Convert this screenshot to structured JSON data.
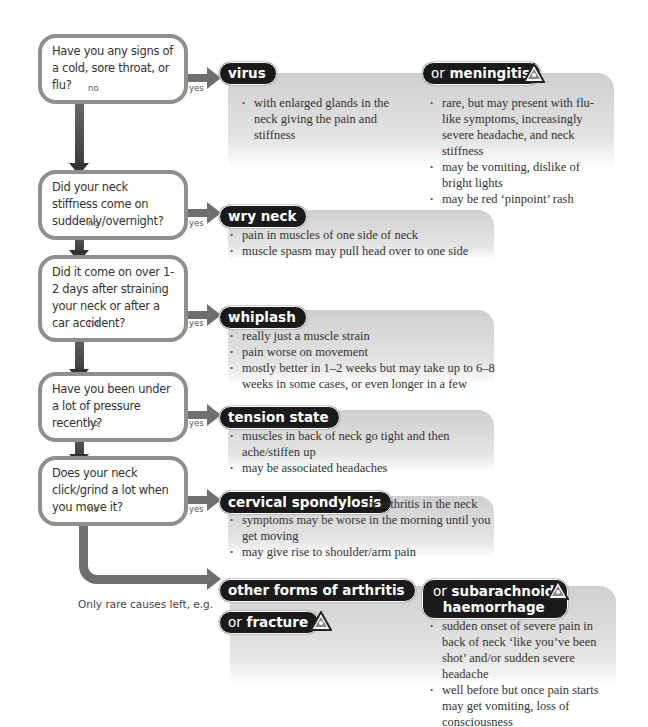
{
  "steps": [
    {
      "question": "Have you any signs of a cold, sore throat, or flu?",
      "no": "no",
      "yes": "yes",
      "diagnosis": "virus",
      "bullets": [
        "with enlarged glands in the neck giving the pain and stiffness"
      ],
      "alternative": {
        "prefix": "or",
        "diagnosis": "meningitis",
        "warning": "warning-triangle",
        "bullets": [
          "rare, but may present with flu-like symptoms, increasingly severe headache, and neck stiffness",
          "may be vomiting, dislike of bright lights",
          "may be red ‘pinpoint’ rash"
        ]
      }
    },
    {
      "question": "Did your neck stiffness come on suddenly/overnight?",
      "no": "no",
      "yes": "yes",
      "diagnosis": "wry neck",
      "bullets": [
        "pain in muscles of one side of neck",
        "muscle spasm may pull head over to one side"
      ]
    },
    {
      "question": "Did it come on over 1-2 days after straining your neck or after a car accident?",
      "no": "no",
      "yes": "yes",
      "diagnosis": "whiplash",
      "bullets": [
        "really just a muscle strain",
        "pain worse on movement",
        "mostly better in 1–2 weeks but may take up to 6–8 weeks in some cases, or even longer in a few"
      ]
    },
    {
      "question": "Have you been under a lot of pressure recently?",
      "no": "no",
      "yes": "yes",
      "diagnosis": "tension state",
      "bullets": [
        "muscles in back of neck go tight and then ache/stiffen up",
        "may be associated headaches"
      ]
    },
    {
      "question": "Does your neck click/grind a lot when you move it?",
      "no": "no",
      "yes": "yes",
      "diagnosis": "cervical spondylosis",
      "aside": "or arthritis in the neck",
      "bullets": [
        "symptoms may be worse in the morning until you get moving",
        "may give rise to shoulder/arm pain"
      ]
    }
  ],
  "final": {
    "label": "Only rare causes left, e.g.",
    "diagnosis": "other forms of arthritis",
    "fracture": {
      "prefix": "or",
      "diagnosis": "fracture",
      "warning": "warning-triangle"
    },
    "subarachnoid": {
      "prefix": "or",
      "diagnosis_line1": "subarachnoid",
      "diagnosis_line2": "haemorrhage",
      "warning": "warning-triangle",
      "bullets": [
        "sudden onset of severe pain in back of neck ‘like you’ve been shot’ and/or sudden severe headache",
        "well before but once pain starts may get vomiting, loss of consciousness"
      ]
    }
  },
  "colors": {
    "pill": "#1a1a1a",
    "arrow": "#6f6f6f",
    "trunk_dark": "#333333",
    "box": "#d4d4d4",
    "question_border": "#8f8f8f"
  }
}
